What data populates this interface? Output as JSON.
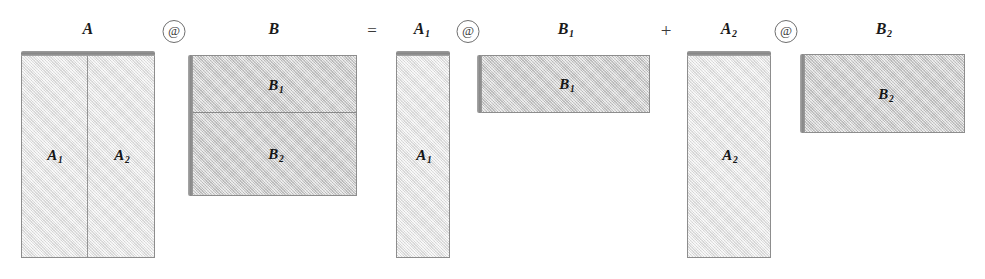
{
  "diagram": {
    "equation_text": "A @ B = A1 @ B1 + A2 @ B2",
    "colors": {
      "fill_light": "#ebebeb",
      "fill_dark": "#d3d3d3",
      "border": "#8d8d8d",
      "edge_shadow": "#878787",
      "text": "#161616",
      "background": "#ffffff"
    }
  },
  "operators": {
    "at_1": "@",
    "at_2": "@",
    "at_3": "@",
    "equals": "=",
    "plus": "+"
  },
  "terms": [
    {
      "id": "term-lhs",
      "label_left": "A",
      "label_right": "B",
      "operator": "@",
      "left_matrix": {
        "name": "A",
        "orientation": "tall",
        "edge": "top",
        "fill": "light",
        "split": "vertical",
        "blocks": [
          {
            "name": "A1",
            "base": "A",
            "subscript": "1"
          },
          {
            "name": "A2",
            "base": "A",
            "subscript": "2"
          }
        ]
      },
      "right_matrix": {
        "name": "B",
        "orientation": "wide",
        "edge": "left",
        "fill": "dark",
        "split": "horizontal",
        "blocks": [
          {
            "name": "B1",
            "base": "B",
            "subscript": "1"
          },
          {
            "name": "B2",
            "base": "B",
            "subscript": "2"
          }
        ]
      }
    },
    {
      "id": "term-1",
      "operator": "@",
      "left_matrix": {
        "name": "A1",
        "base": "A",
        "subscript": "1",
        "orientation": "tall",
        "edge": "top",
        "fill": "light",
        "split": "none"
      },
      "right_matrix": {
        "name": "B1",
        "base": "B",
        "subscript": "1",
        "orientation": "wide",
        "edge": "left",
        "fill": "dark",
        "split": "none"
      }
    },
    {
      "id": "term-2",
      "operator": "@",
      "left_matrix": {
        "name": "A2",
        "base": "A",
        "subscript": "2",
        "orientation": "tall",
        "edge": "top",
        "fill": "light",
        "split": "none"
      },
      "right_matrix": {
        "name": "B2",
        "base": "B",
        "subscript": "2",
        "orientation": "wide",
        "edge": "left",
        "fill": "dark",
        "split": "none"
      }
    }
  ],
  "labels": {
    "A": "A",
    "B": "B",
    "A1_base": "A",
    "A1_sub": "1",
    "A2_base": "A",
    "A2_sub": "2",
    "B1_base": "B",
    "B1_sub": "1",
    "B2_base": "B",
    "B2_sub": "2"
  }
}
